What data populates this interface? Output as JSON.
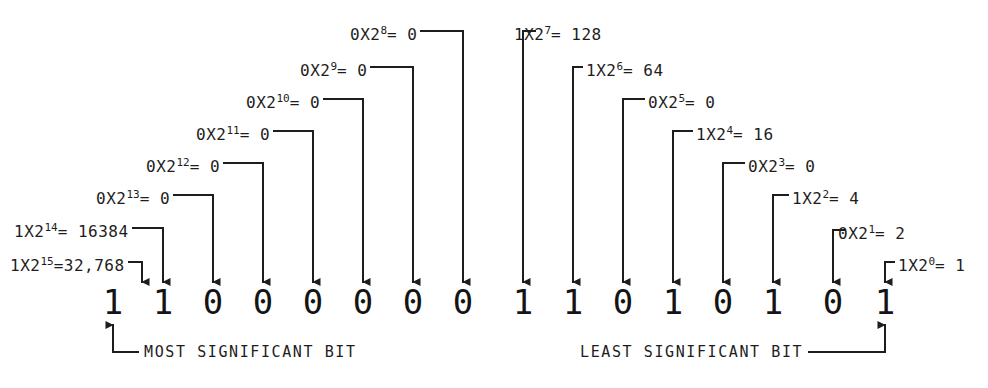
{
  "diagram": {
    "bit_string": "1100000011010101",
    "ink_color": "#1d1d1d",
    "background_color": "#ffffff",
    "bits": [
      {
        "index": 15,
        "value": "1",
        "x": 113
      },
      {
        "index": 14,
        "value": "1",
        "x": 163
      },
      {
        "index": 13,
        "value": "0",
        "x": 213
      },
      {
        "index": 12,
        "value": "0",
        "x": 263
      },
      {
        "index": 11,
        "value": "0",
        "x": 313
      },
      {
        "index": 10,
        "value": "0",
        "x": 363
      },
      {
        "index": 9,
        "value": "0",
        "x": 413
      },
      {
        "index": 8,
        "value": "0",
        "x": 463
      },
      {
        "index": 7,
        "value": "1",
        "x": 523
      },
      {
        "index": 6,
        "value": "1",
        "x": 573
      },
      {
        "index": 5,
        "value": "0",
        "x": 623
      },
      {
        "index": 4,
        "value": "1",
        "x": 673
      },
      {
        "index": 3,
        "value": "0",
        "x": 723
      },
      {
        "index": 2,
        "value": "1",
        "x": 773
      },
      {
        "index": 1,
        "value": "0",
        "x": 833
      },
      {
        "index": 0,
        "value": "1",
        "x": 885
      }
    ],
    "annotations": [
      {
        "id": "pow15",
        "coeff": "1",
        "mult": "X2",
        "exp": "15",
        "eq": "=32,768",
        "text": "1X2¹⁵=32,768",
        "bit": 15,
        "side": "left",
        "label_x": 10,
        "label_y": 256,
        "elbow_x": 142,
        "elbow_y": 262
      },
      {
        "id": "pow14",
        "coeff": "1",
        "mult": "X2",
        "exp": "14",
        "eq": "= 16384",
        "text": "1X2¹⁴ = 16384",
        "bit": 14,
        "side": "left",
        "label_x": 14,
        "label_y": 222,
        "elbow_x": 163,
        "elbow_y": 228
      },
      {
        "id": "pow13",
        "coeff": "0",
        "mult": "X2",
        "exp": "13",
        "eq": "= 0",
        "text": "0X2¹³ = 0",
        "bit": 13,
        "side": "left",
        "label_x": 96,
        "label_y": 189,
        "elbow_x": 213,
        "elbow_y": 195
      },
      {
        "id": "pow12",
        "coeff": "0",
        "mult": "X2",
        "exp": "12",
        "eq": "= 0",
        "text": "0X2¹² = 0",
        "bit": 12,
        "side": "left",
        "label_x": 146,
        "label_y": 157,
        "elbow_x": 263,
        "elbow_y": 163
      },
      {
        "id": "pow11",
        "coeff": "0",
        "mult": "X2",
        "exp": "11",
        "eq": "= 0",
        "text": "0X2¹¹ = 0",
        "bit": 11,
        "side": "left",
        "label_x": 196,
        "label_y": 125,
        "elbow_x": 313,
        "elbow_y": 131
      },
      {
        "id": "pow10",
        "coeff": "0",
        "mult": "X2",
        "exp": "10",
        "eq": "= 0",
        "text": "0X2¹⁰ = 0",
        "bit": 10,
        "side": "left",
        "label_x": 246,
        "label_y": 93,
        "elbow_x": 363,
        "elbow_y": 99
      },
      {
        "id": "pow9",
        "coeff": "0",
        "mult": "X2",
        "exp": "9",
        "eq": "= 0",
        "text": "0X2⁹ = 0",
        "bit": 9,
        "side": "left",
        "label_x": 300,
        "label_y": 61,
        "elbow_x": 413,
        "elbow_y": 67
      },
      {
        "id": "pow8",
        "coeff": "0",
        "mult": "X2",
        "exp": "8",
        "eq": "= 0",
        "text": "0X2⁸ = 0",
        "bit": 8,
        "side": "left",
        "label_x": 350,
        "label_y": 25,
        "elbow_x": 463,
        "elbow_y": 31
      },
      {
        "id": "pow7",
        "coeff": "1",
        "mult": "X2",
        "exp": "7",
        "eq": "= 128",
        "text": "1X2⁷ = 128",
        "bit": 7,
        "side": "right",
        "label_x": 514,
        "label_y": 25,
        "elbow_x": 523,
        "elbow_y": 31
      },
      {
        "id": "pow6",
        "coeff": "1",
        "mult": "X2",
        "exp": "6",
        "eq": "= 64",
        "text": "1X2⁶ = 64",
        "bit": 6,
        "side": "right",
        "label_x": 586,
        "label_y": 61,
        "elbow_x": 573,
        "elbow_y": 67
      },
      {
        "id": "pow5",
        "coeff": "0",
        "mult": "X2",
        "exp": "5",
        "eq": "= 0",
        "text": "0X2⁵ = 0",
        "bit": 5,
        "side": "right",
        "label_x": 648,
        "label_y": 93,
        "elbow_x": 623,
        "elbow_y": 99
      },
      {
        "id": "pow4",
        "coeff": "1",
        "mult": "X2",
        "exp": "4",
        "eq": "= 16",
        "text": "1X2⁴ = 16",
        "bit": 4,
        "side": "right",
        "label_x": 696,
        "label_y": 125,
        "elbow_x": 673,
        "elbow_y": 131
      },
      {
        "id": "pow3",
        "coeff": "0",
        "mult": "X2",
        "exp": "3",
        "eq": "= 0",
        "text": "0X2³ = 0",
        "bit": 3,
        "side": "right",
        "label_x": 748,
        "label_y": 157,
        "elbow_x": 723,
        "elbow_y": 163
      },
      {
        "id": "pow2",
        "coeff": "1",
        "mult": "X2",
        "exp": "2",
        "eq": "= 4",
        "text": "1X2² = 4",
        "bit": 2,
        "side": "right",
        "label_x": 792,
        "label_y": 189,
        "elbow_x": 773,
        "elbow_y": 195
      },
      {
        "id": "pow1",
        "coeff": "0",
        "mult": "X2",
        "exp": "1",
        "eq": "= 2",
        "text": "0X2¹ = 2",
        "bit": 1,
        "side": "right",
        "label_x": 838,
        "label_y": 224,
        "elbow_x": 833,
        "elbow_y": 230
      },
      {
        "id": "pow0",
        "coeff": "1",
        "mult": "X2",
        "exp": "0",
        "eq": "= 1",
        "text": "1X2⁰ = 1",
        "bit": 0,
        "side": "right",
        "label_x": 898,
        "label_y": 256,
        "elbow_x": 885,
        "elbow_y": 262
      }
    ],
    "captions": [
      {
        "id": "msb",
        "text": "MOST SIGNIFICANT BIT",
        "x": 144,
        "y": 345,
        "bit": 15,
        "side": "left"
      },
      {
        "id": "lsb",
        "text": "LEAST SIGNIFICANT BIT",
        "x": 580,
        "y": 345,
        "bit": 0,
        "side": "right"
      }
    ]
  }
}
